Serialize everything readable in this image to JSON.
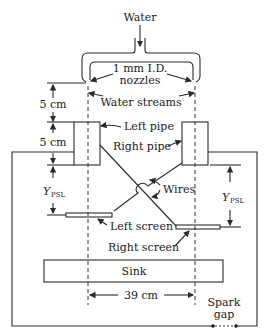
{
  "diagram": {
    "type": "schematic",
    "labels": {
      "water": "Water",
      "nozzles_line1": "1 mm I.D.",
      "nozzles_line2": "nozzles",
      "water_streams": "Water streams",
      "left_pipe": "Left pipe",
      "right_pipe": "Right pipe",
      "wires": "Wires",
      "left_screen": "Left screen",
      "right_screen": "Right screen",
      "sink": "Sink",
      "spark_gap_line1": "Spark",
      "spark_gap_line2": "gap"
    },
    "dimensions": {
      "nozzle_to_pipe": "5 cm",
      "pipe_height": "5 cm",
      "ypsl_left_main": "Y",
      "ypsl_left_sub": "PSL",
      "ypsl_right_main": "Y",
      "ypsl_right_sub": "PSL",
      "stream_separation": "39 cm"
    },
    "colors": {
      "line": "#2a2a2a",
      "text": "#1a1a1a",
      "background": "#ffffff"
    }
  }
}
